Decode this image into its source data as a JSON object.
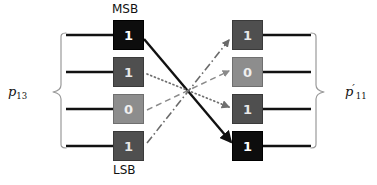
{
  "figure": {
    "width": 377,
    "height": 185,
    "background": "#ffffff"
  },
  "annotations": {
    "msb_label": "MSB",
    "lsb_label": "LSB",
    "left_group_base": "p",
    "left_group_sub": "13",
    "right_group_base": "p",
    "right_group_sub": "11",
    "right_group_prime": "′"
  },
  "colors": {
    "black_box": "#0d0d0d",
    "dark_box": "#4f4f4f",
    "mid_box": "#8d8d8d",
    "wire": "#1a1a1a",
    "brace": "#9a9a9a",
    "text_on_dark": "#e8e8e8",
    "text_on_black": "#ffffff"
  },
  "left_column": {
    "name": "p13",
    "x": 113,
    "bits": [
      {
        "row": 1,
        "value": "1",
        "tone": "tone-black",
        "y": 20,
        "role": "msb"
      },
      {
        "row": 2,
        "value": "1",
        "tone": "tone-dark",
        "y": 57,
        "role": ""
      },
      {
        "row": 3,
        "value": "0",
        "tone": "tone-mid",
        "y": 94,
        "role": ""
      },
      {
        "row": 4,
        "value": "1",
        "tone": "tone-dark",
        "y": 131,
        "role": "lsb"
      }
    ]
  },
  "right_column": {
    "name": "p11prime",
    "x": 232,
    "bits": [
      {
        "row": 1,
        "value": "1",
        "tone": "tone-dark",
        "y": 20
      },
      {
        "row": 2,
        "value": "0",
        "tone": "tone-mid",
        "y": 57
      },
      {
        "row": 3,
        "value": "1",
        "tone": "tone-dark",
        "y": 94
      },
      {
        "row": 4,
        "value": "1",
        "tone": "tone-black",
        "y": 131
      }
    ]
  },
  "permutation_edges": [
    {
      "id": "edge-1",
      "from_row": 1,
      "to_row": 4,
      "style": "solid",
      "stroke": "#111111",
      "width": 2.4,
      "dash": "none",
      "arrow": true
    },
    {
      "id": "edge-2",
      "from_row": 2,
      "to_row": 3,
      "style": "dotted",
      "stroke": "#707070",
      "width": 1.6,
      "dash": "1,3",
      "arrow": true
    },
    {
      "id": "edge-3",
      "from_row": 3,
      "to_row": 2,
      "style": "dashed",
      "stroke": "#8a8a8a",
      "width": 1.5,
      "dash": "6,4",
      "arrow": true
    },
    {
      "id": "edge-4",
      "from_row": 4,
      "to_row": 1,
      "style": "dashdot",
      "stroke": "#6a6a6a",
      "width": 1.6,
      "dash": "8,3,1.5,3",
      "arrow": true
    }
  ],
  "stub_wires": {
    "left_x_start": 66,
    "left_x_end": 113,
    "right_x_start": 263,
    "right_x_end": 310,
    "rows_y": [
      35,
      72,
      109,
      146
    ]
  },
  "braces": {
    "left": {
      "x_spine": 61,
      "y_top": 33,
      "y_bottom": 148,
      "tip_x": 50,
      "tip_y": 92
    },
    "right": {
      "x_spine": 315,
      "y_top": 33,
      "y_bottom": 148,
      "tip_x": 327,
      "tip_y": 92
    }
  }
}
